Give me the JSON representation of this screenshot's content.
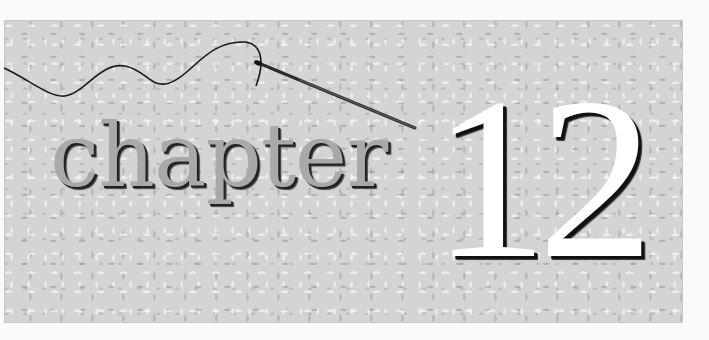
{
  "title": {
    "word": "chapter",
    "number": "12"
  },
  "colors": {
    "page_background": "#fafafa",
    "panel_texture": "#d4d4d4",
    "word_fill": "#a9a9a9",
    "number_fill": "#ffffff",
    "shadow": "#111111",
    "thread": "#1a1a1a"
  },
  "decorations": {
    "needle": "sewing-needle-with-thread"
  }
}
